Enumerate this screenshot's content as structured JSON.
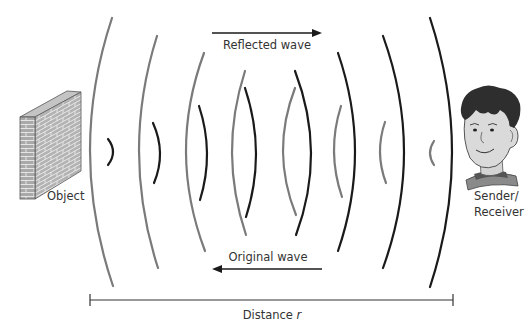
{
  "diagram": {
    "labels": {
      "object": "Object",
      "sender_line1": "Sender/",
      "sender_line2": "Receiver",
      "reflected_wave": "Reflected wave",
      "original_wave": "Original wave",
      "distance_prefix": "Distance ",
      "distance_var": "r"
    },
    "colors": {
      "original_wave": "#1a1a1a",
      "reflected_wave": "#7a7a7a",
      "text": "#333333",
      "brick": "#a9a9a9",
      "mortar": "#e4e4e4"
    },
    "arrows": {
      "reflected_wave_direction": "right",
      "original_wave_direction": "left"
    },
    "reflected_wave_arcs": [
      {
        "top": [
          112,
          18
        ],
        "bottom": [
          113,
          286
        ],
        "apex_x": 90
      },
      {
        "top": [
          157,
          36
        ],
        "bottom": [
          158,
          268
        ],
        "apex_x": 139
      },
      {
        "top": [
          204,
          53
        ],
        "bottom": [
          205,
          251
        ],
        "apex_x": 186
      },
      {
        "top": [
          245,
          71
        ],
        "bottom": [
          246,
          235
        ],
        "apex_x": 232
      },
      {
        "top": [
          295,
          88
        ],
        "bottom": [
          296,
          215
        ],
        "apex_x": 283
      },
      {
        "top": [
          341,
          106
        ],
        "bottom": [
          342,
          197
        ],
        "apex_x": 334
      },
      {
        "top": [
          385,
          122
        ],
        "bottom": [
          386,
          183
        ],
        "apex_x": 380
      },
      {
        "top": [
          434,
          141
        ],
        "bottom": [
          434,
          165
        ],
        "apex_x": 430
      }
    ],
    "original_wave_arcs": [
      {
        "top": [
          108,
          139
        ],
        "bottom": [
          108,
          165
        ],
        "apex_x": 113
      },
      {
        "top": [
          153,
          123
        ],
        "bottom": [
          154,
          183
        ],
        "apex_x": 160
      },
      {
        "top": [
          199,
          106
        ],
        "bottom": [
          200,
          200
        ],
        "apex_x": 207
      },
      {
        "top": [
          245,
          88
        ],
        "bottom": [
          246,
          217
        ],
        "apex_x": 256
      },
      {
        "top": [
          295,
          71
        ],
        "bottom": [
          296,
          235
        ],
        "apex_x": 311
      },
      {
        "top": [
          338,
          53
        ],
        "bottom": [
          338,
          251
        ],
        "apex_x": 355
      },
      {
        "top": [
          383,
          36
        ],
        "bottom": [
          383,
          268
        ],
        "apex_x": 404
      },
      {
        "top": [
          430,
          18
        ],
        "bottom": [
          430,
          287
        ],
        "apex_x": 452
      }
    ]
  }
}
